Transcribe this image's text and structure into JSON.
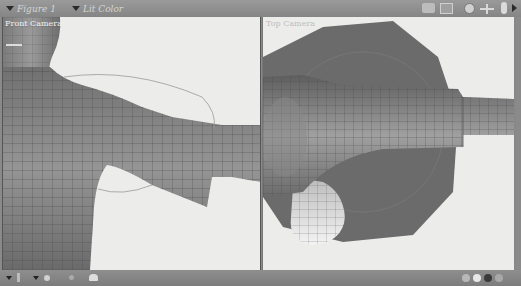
{
  "toolbar": {
    "figure_dropdown": "Figure 1",
    "display_dropdown": "Lit Color",
    "icons": [
      "camera-icon",
      "window-icon",
      "trackball-icon",
      "move-icon",
      "scale-icon",
      "expand-arrow-icon"
    ]
  },
  "viewports": {
    "left": {
      "label": "Front Camera"
    },
    "right": {
      "label": "Top Camera"
    }
  },
  "bottombar": {
    "left_icons": [
      "menu-triangle-icon",
      "layout-icon",
      "menu-triangle-icon",
      "light-icon",
      "tool-icon",
      "lamp-icon"
    ],
    "right_icons": [
      "color-ball-icon",
      "color-ball-icon",
      "color-ball-icon",
      "color-ball-icon"
    ]
  },
  "colors": {
    "toolbar_bg": "#8f8f8f",
    "viewport_bg": "#ececea",
    "mesh": "#8c8c8c",
    "sphere": "#6a6a6a"
  }
}
